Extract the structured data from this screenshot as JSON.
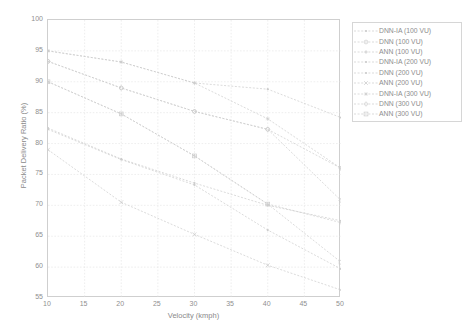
{
  "chart_data": {
    "type": "line",
    "title": "",
    "subtitle": "",
    "xlabel": "Velocity (kmph)",
    "ylabel": "Packet Delivery Ratio (%)",
    "xlim": [
      10,
      50
    ],
    "ylim": [
      55,
      100
    ],
    "xticks": [
      10,
      15,
      20,
      25,
      30,
      35,
      40,
      45,
      50
    ],
    "yticks": [
      55,
      60,
      65,
      70,
      75,
      80,
      85,
      90,
      95,
      100
    ],
    "grid": true,
    "legend_position": "right-outside",
    "x": [
      10,
      20,
      30,
      40,
      50
    ],
    "series": [
      {
        "name": "DNN-IA (100 VU)",
        "marker": "dot",
        "values": [
          95.0,
          93.2,
          89.8,
          88.8,
          84.2
        ]
      },
      {
        "name": "DNN (100 VU)",
        "marker": "circle",
        "values": [
          93.3,
          89.0,
          85.2,
          82.3,
          76.0
        ]
      },
      {
        "name": "ANN (100 VU)",
        "marker": "plus",
        "values": [
          90.0,
          84.8,
          78.0,
          70.2,
          67.2
        ]
      },
      {
        "name": "DNN-IA (200 VU)",
        "marker": "dot",
        "values": [
          82.5,
          77.5,
          73.6,
          70.0,
          67.5
        ]
      },
      {
        "name": "DNN (200 VU)",
        "marker": "dot",
        "values": [
          82.3,
          77.4,
          73.3,
          66.0,
          59.7
        ]
      },
      {
        "name": "ANN (200 VU)",
        "marker": "x",
        "values": [
          79.0,
          70.5,
          65.3,
          60.3,
          56.3
        ]
      },
      {
        "name": "DNN-IA (300 VU)",
        "marker": "star",
        "values": [
          95.0,
          93.2,
          89.8,
          84.0,
          76.0
        ]
      },
      {
        "name": "DNN (300 VU)",
        "marker": "diamond",
        "values": [
          93.3,
          89.0,
          85.2,
          82.3,
          70.8
        ]
      },
      {
        "name": "ANN (300 VU)",
        "marker": "square",
        "values": [
          90.0,
          84.8,
          78.0,
          70.2,
          60.8
        ]
      }
    ],
    "colors": {
      "axis": "#cfcfcf",
      "grid": "#e3e3e3",
      "tick_text": "#8f8f8f",
      "series_ink": "#cccccc",
      "legend_border": "#d6d6d6"
    }
  },
  "legend": {
    "entries": [
      {
        "label": "DNN-IA (100 VU)"
      },
      {
        "label": "DNN (100 VU)"
      },
      {
        "label": "ANN (100 VU)"
      },
      {
        "label": "DNN-IA (200 VU)"
      },
      {
        "label": "DNN (200 VU)"
      },
      {
        "label": "ANN (200 VU)"
      },
      {
        "label": "DNN-IA (300 VU)"
      },
      {
        "label": "DNN (300 VU)"
      },
      {
        "label": "ANN (300 VU)"
      }
    ]
  },
  "axes": {
    "x_title": "Velocity (kmph)",
    "y_title": "Packet Delivery Ratio (%)",
    "x_tick_labels": [
      "10",
      "15",
      "20",
      "25",
      "30",
      "35",
      "40",
      "45",
      "50"
    ],
    "y_tick_labels": [
      "55",
      "60",
      "65",
      "70",
      "75",
      "80",
      "85",
      "90",
      "95",
      "100"
    ]
  }
}
